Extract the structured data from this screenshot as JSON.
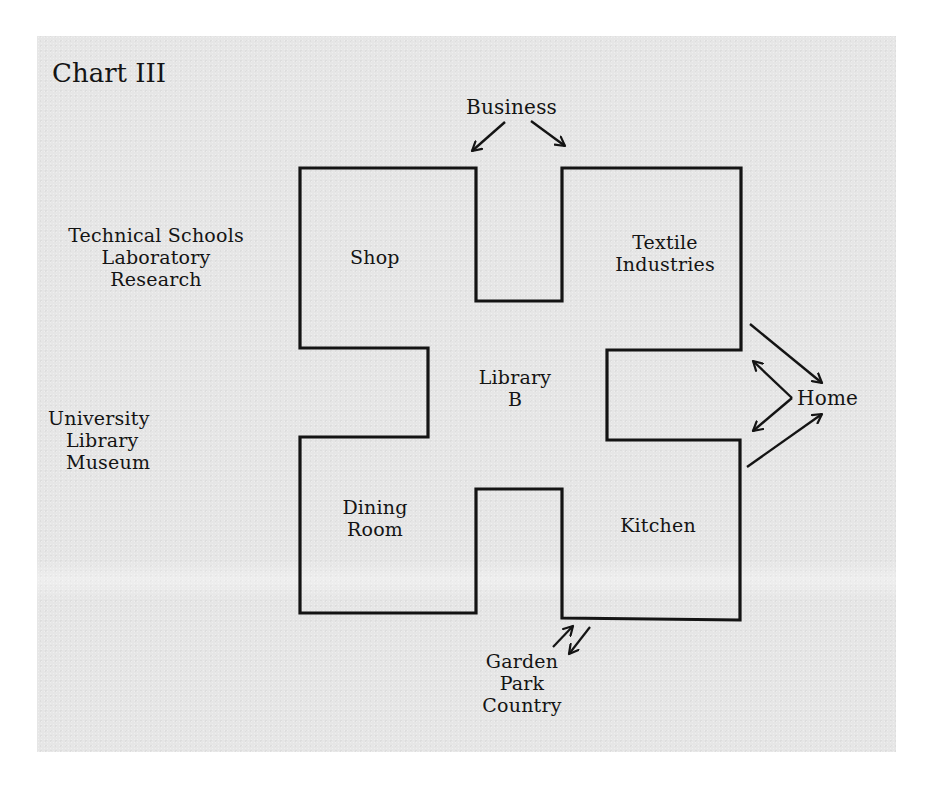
{
  "title": "Chart III",
  "floor_plan": {
    "center": {
      "line1": "Library",
      "line2": "B"
    },
    "rooms": [
      {
        "name": "Shop",
        "lines": [
          "Shop"
        ]
      },
      {
        "name": "Textile Industries",
        "lines": [
          "Textile",
          "Industries"
        ]
      },
      {
        "name": "Dining Room",
        "lines": [
          "Dining",
          "Room"
        ]
      },
      {
        "name": "Kitchen",
        "lines": [
          "Kitchen"
        ]
      }
    ]
  },
  "external_labels": {
    "business": "Business",
    "home": "Home",
    "garden_group": [
      "Garden",
      "Park",
      "Country"
    ],
    "technical_group": [
      "Technical Schools",
      "Laboratory",
      "Research"
    ],
    "university_group": [
      "University",
      "Library",
      "Museum"
    ]
  },
  "colors": {
    "background": "#ffffff",
    "panel": "#e6e6e6",
    "ink": "#141414"
  }
}
